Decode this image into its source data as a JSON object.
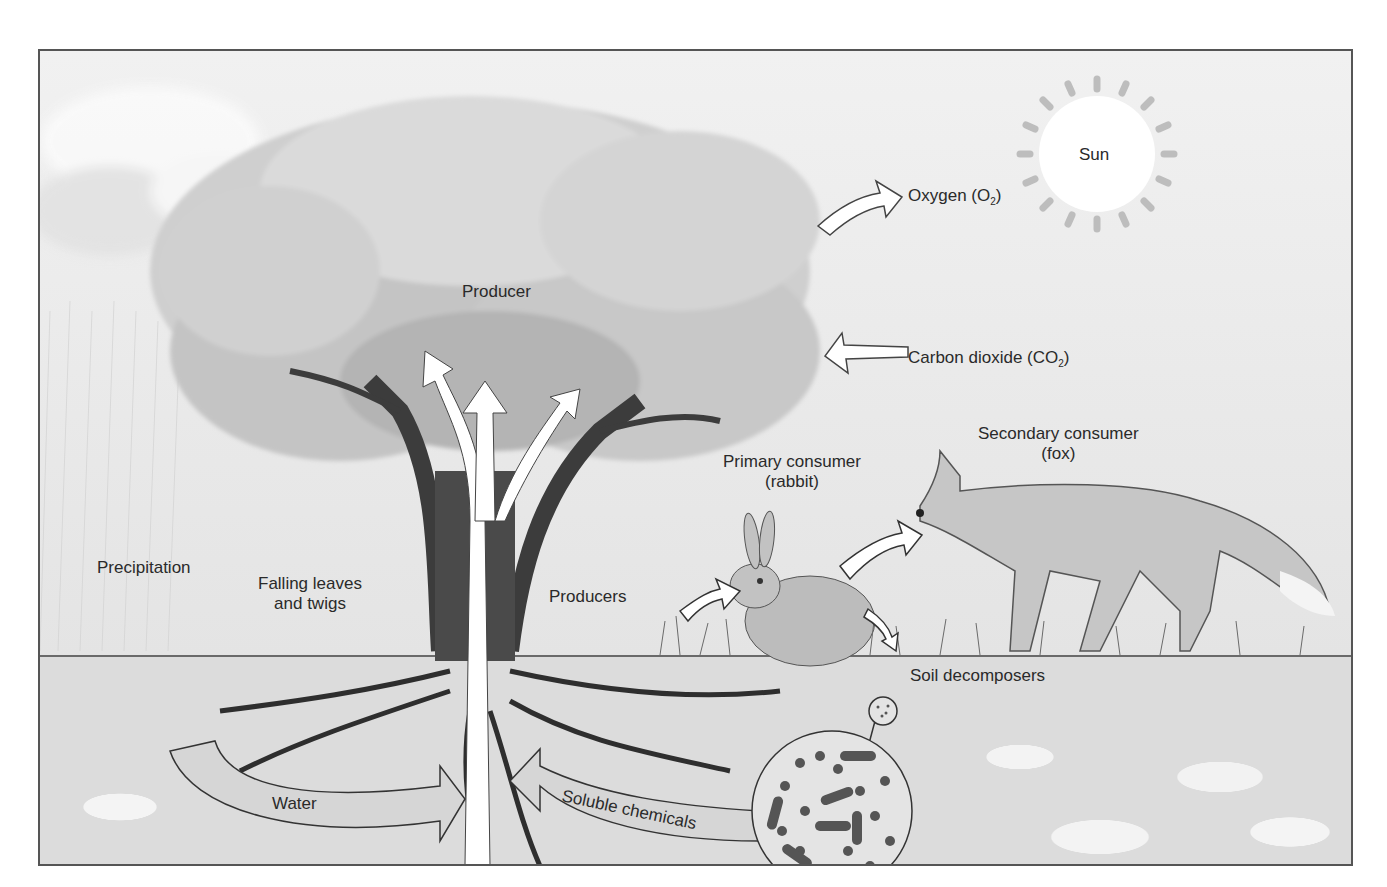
{
  "diagram": {
    "type": "ecosystem-illustration",
    "style": "grayscale textbook illustration",
    "labels": {
      "sun": "Sun",
      "oxygen": "Oxygen (O",
      "oxygen_sub": "2",
      "oxygen_close": ")",
      "carbon_dioxide": "Carbon dioxide (CO",
      "carbon_dioxide_sub": "2",
      "carbon_dioxide_close": ")",
      "producer": "Producer",
      "precipitation": "Precipitation",
      "falling_leaves_line1": "Falling leaves",
      "falling_leaves_line2": "and twigs",
      "producers": "Producers",
      "primary_consumer_line1": "Primary consumer",
      "primary_consumer_line2": "(rabbit)",
      "secondary_consumer_line1": "Secondary consumer",
      "secondary_consumer_line2": "(fox)",
      "soil_decomposers": "Soil decomposers",
      "water": "Water",
      "soluble_chemicals": "Soluble chemicals"
    },
    "flows": [
      {
        "from": "tree",
        "to": "atmosphere",
        "label": "Oxygen (O2)"
      },
      {
        "from": "atmosphere",
        "to": "tree",
        "label": "Carbon dioxide (CO2)"
      },
      {
        "from": "soil",
        "to": "tree",
        "label": "Water"
      },
      {
        "from": "soil decomposers",
        "to": "tree roots",
        "label": "Soluble chemicals"
      },
      {
        "from": "producers",
        "to": "primary consumer (rabbit)"
      },
      {
        "from": "primary consumer (rabbit)",
        "to": "secondary consumer (fox)"
      },
      {
        "from": "rabbit",
        "to": "ground (waste)"
      },
      {
        "from": "roots",
        "to": "canopy",
        "label": "upward transport (3 arrows)"
      }
    ],
    "colors": {
      "frame_border": "#555555",
      "label_text": "#2a2a2a",
      "arrow_fill": "#ffffff",
      "soil_arrow_fill": "#d6d6d6"
    }
  }
}
